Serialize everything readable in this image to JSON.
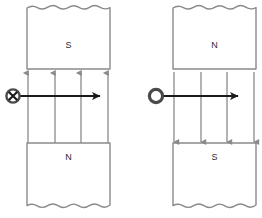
{
  "figure": {
    "type": "physics-diagram",
    "background_color": "#ffffff",
    "magnet_edge_color": "#8a8a8a",
    "field_line_color": "#8a8a8a",
    "current_arrow_color": "#1a1a1a",
    "label_color": "#2b2b2b"
  },
  "panels": [
    {
      "id": "left",
      "name": "panel-left",
      "top_magnet": {
        "label": "S",
        "x": 27,
        "y": 5,
        "width": 83,
        "height": 64,
        "torn_edge": "top"
      },
      "bottom_magnet": {
        "label": "N",
        "x": 27,
        "y": 143,
        "width": 83,
        "height": 66,
        "torn_edge": "bottom"
      },
      "field": {
        "direction": "up",
        "line_count": 4,
        "x_positions": [
          28,
          55,
          81,
          108
        ],
        "y_start": 143,
        "y_end": 72
      },
      "current": {
        "symbol": "cross-in-circle",
        "meaning": "into-page",
        "symbol_x": 13,
        "symbol_y": 96,
        "symbol_radius": 7,
        "arrow_from_x": 13,
        "arrow_to_x": 101,
        "arrow_y": 96
      }
    },
    {
      "id": "right",
      "name": "panel-right",
      "top_magnet": {
        "label": "N",
        "x": 42,
        "y": 5,
        "width": 83,
        "height": 64,
        "torn_edge": "top"
      },
      "bottom_magnet": {
        "label": "S",
        "x": 42,
        "y": 143,
        "width": 83,
        "height": 66,
        "torn_edge": "bottom"
      },
      "field": {
        "direction": "down",
        "line_count": 4,
        "x_positions": [
          43,
          70,
          96,
          123
        ],
        "y_start": 72,
        "y_end": 143
      },
      "current": {
        "symbol": "dot-in-circle",
        "meaning": "out-of-page",
        "symbol_x": 25,
        "symbol_y": 96,
        "symbol_radius": 7,
        "arrow_from_x": 25,
        "arrow_to_x": 108,
        "arrow_y": 96
      }
    }
  ]
}
